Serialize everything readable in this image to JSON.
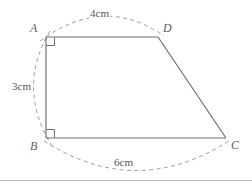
{
  "figure": {
    "kind": "right-trapezoid-geometry-diagram",
    "canvas": {
      "width": 252,
      "height": 187,
      "background": "#ffffff"
    },
    "colors": {
      "solid_stroke": "#6e6e76",
      "dashed_stroke": "#9a9aa2",
      "label_text": "#5b5b60",
      "measure_text": "#53535a",
      "divider": "#b4b4b9"
    },
    "vertices": [
      {
        "name": "A",
        "label": "A",
        "x": 46,
        "y": 37,
        "label_x": 30,
        "label_y": 22
      },
      {
        "name": "D",
        "label": "D",
        "x": 158,
        "y": 37,
        "label_x": 163,
        "label_y": 22
      },
      {
        "name": "B",
        "label": "B",
        "x": 46,
        "y": 138,
        "label_x": 30,
        "label_y": 140
      },
      {
        "name": "C",
        "label": "C",
        "x": 226,
        "y": 138,
        "label_x": 231,
        "label_y": 139
      }
    ],
    "edges": [
      {
        "name": "edge-AD",
        "from": "A",
        "to": "D",
        "style": "solid"
      },
      {
        "name": "edge-AB",
        "from": "A",
        "to": "B",
        "style": "solid"
      },
      {
        "name": "edge-BC",
        "from": "B",
        "to": "C",
        "style": "solid"
      },
      {
        "name": "edge-DC",
        "from": "D",
        "to": "C",
        "style": "solid"
      }
    ],
    "right_angles": [
      {
        "name": "right-angle-A",
        "at": "A",
        "size": 8
      },
      {
        "name": "right-angle-B",
        "at": "B",
        "size": 8
      }
    ],
    "measurements": [
      {
        "name": "measure-AD",
        "edge": "AD",
        "value": "4cm",
        "label_x": 89,
        "label_y": 8,
        "arc_side": "top"
      },
      {
        "name": "measure-AB",
        "edge": "AB",
        "value": "3cm",
        "label_x": 11,
        "label_y": 81,
        "arc_side": "left"
      },
      {
        "name": "measure-BC",
        "edge": "BC",
        "value": "6cm",
        "label_x": 113,
        "label_y": 157,
        "arc_side": "bottom"
      }
    ],
    "divider": {
      "name": "bottom-divider",
      "y": 180
    }
  }
}
